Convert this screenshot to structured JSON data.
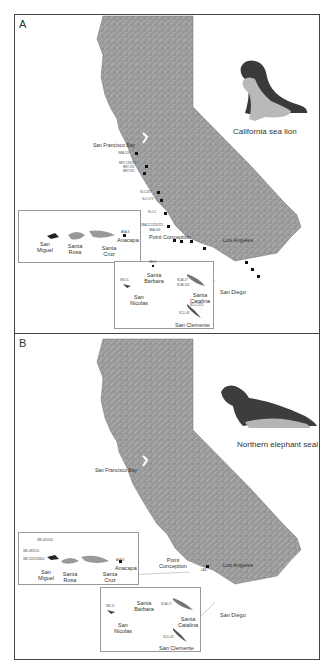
{
  "figure": {
    "panels": [
      {
        "label": "A",
        "species": "California sea lion",
        "place_labels": {
          "sf_bay": "San Francisco Bay",
          "point_conception": "Point Conception",
          "los_angeles": "Los Angeles",
          "san_diego": "San Diego"
        },
        "islands": {
          "san_miguel": "San Miguel",
          "santa_rosa": "Santa Rosa",
          "santa_cruz": "Santa Cruz",
          "anacapa": "Anacapa",
          "santa_barbara": "Santa Barbara",
          "san_nicolas": "San Nicolas",
          "santa_catalina": "Santa Catalina",
          "san_clemente": "San Clemente"
        },
        "site_labels": {
          "smm": "SMA-119",
          "mnt1": "MNT-228/229",
          "mnt2": "MNT-391",
          "mnt3": "MNT-931",
          "slo1": "SLO-267",
          "slo2": "SLO-179",
          "slo3": "SLO-2",
          "sba1": "SBA-212/224/225",
          "sba2": "SBA-506",
          "ana": "ANA-8",
          "sni": "SNI-11",
          "sba_isl": "SBI-8",
          "scai": "SCAI-17",
          "scai2": "SCAI-133",
          "scli1": "SCLI-1215",
          "scli2": "SCLI-43"
        }
      },
      {
        "label": "B",
        "species": "Northern elephant seal",
        "place_labels": {
          "sf_bay": "San Francisco Bay",
          "point_conception": "Point Conception",
          "los_angeles": "Los Angeles",
          "san_diego": "San Diego"
        },
        "islands": {
          "san_miguel": "San Miguel",
          "santa_rosa": "Santa Rosa",
          "santa_cruz": "Santa Cruz",
          "anacapa": "Anacapa",
          "santa_barbara": "Santa Barbara",
          "san_nicolas": "San Nicolas",
          "santa_catalina": "Santa Catalina",
          "san_clemente": "San Clemente"
        },
        "site_labels": {
          "smi1": "SMI-405/401",
          "smi2": "SMI-485/510",
          "smi3": "SMI-525/528/602",
          "ana": "ANA-8",
          "sni": "SNI-11",
          "scai": "SCAI-17",
          "scli": "SCLI-43",
          "lan": "LAN-"
        }
      }
    ]
  }
}
